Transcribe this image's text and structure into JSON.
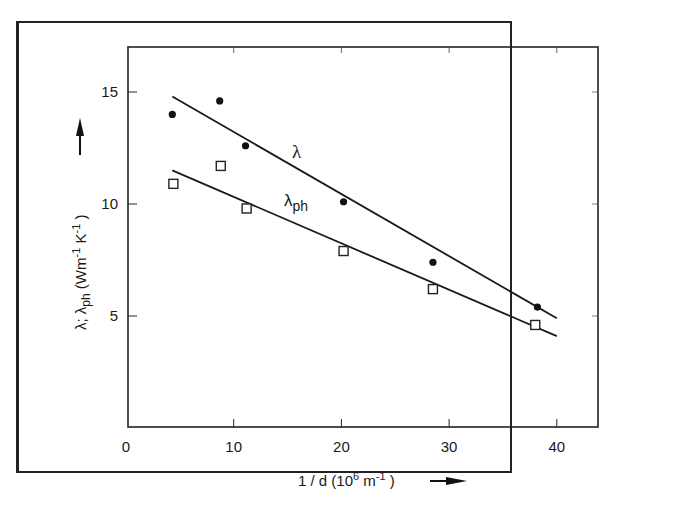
{
  "chart_data": {
    "type": "scatter",
    "title": "",
    "xlabel": "1 / d (10^6 m^-1)",
    "ylabel": "λ; λph (Wm^-1 K^-1)",
    "xlim": [
      0,
      43
    ],
    "ylim": [
      0,
      17
    ],
    "x_ticks": [
      0,
      10,
      20,
      30,
      40
    ],
    "y_ticks": [
      5,
      10,
      15
    ],
    "grid": false,
    "legend": "inline labels",
    "series": [
      {
        "name": "λ",
        "marker": "filled-circle",
        "x": [
          4.3,
          8.7,
          11.1,
          20.2,
          28.5,
          38.2
        ],
        "y": [
          14.0,
          14.6,
          12.6,
          10.1,
          7.4,
          5.4
        ],
        "fit_line": {
          "x": [
            4.3,
            40
          ],
          "y": [
            14.8,
            4.9
          ]
        }
      },
      {
        "name": "λph",
        "marker": "open-square",
        "x": [
          4.4,
          8.8,
          11.2,
          20.2,
          28.5,
          38.0
        ],
        "y": [
          10.9,
          11.7,
          9.8,
          7.9,
          6.2,
          4.6
        ],
        "fit_line": {
          "x": [
            4.3,
            40
          ],
          "y": [
            11.5,
            4.1
          ]
        }
      }
    ],
    "annotations": [
      {
        "text": "λ",
        "x": 15.8,
        "y": 12.3
      },
      {
        "text": "λph",
        "x": 14.8,
        "y": 9.8
      }
    ]
  },
  "labels": {
    "x_axis_main": "1 / d (10",
    "x_axis_sup1": "6",
    "x_axis_mid": " m",
    "x_axis_sup2": "-1",
    "x_axis_end": " )",
    "y_axis_main": "λ; λ",
    "y_axis_sub": "ph",
    "y_axis_rest": " (Wm",
    "y_axis_sup1": "-1",
    "y_axis_k": " K",
    "y_axis_sup2": "-1",
    "y_axis_end": " )",
    "series_label_lambda": "λ",
    "series_label_lambda_ph_main": "λ",
    "series_label_lambda_ph_sub": "ph",
    "x_ticks": [
      "0",
      "10",
      "20",
      "30",
      "40"
    ],
    "y_ticks": [
      "5",
      "10",
      "15"
    ]
  }
}
